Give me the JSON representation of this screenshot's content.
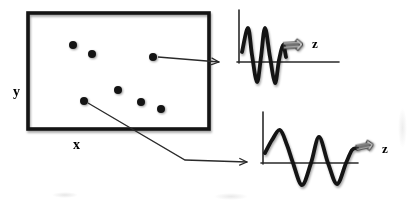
{
  "figure": {
    "background_color": "#ffffff",
    "ink_color": "#141414",
    "thin_line_color": "#2a2a2a",
    "block_arrow_fill": "#c6c6c6",
    "region_box": {
      "x": 28,
      "y": 13,
      "width": 181,
      "height": 116,
      "border_width": 3.6,
      "x_axis_label": "x",
      "y_axis_label": "y"
    },
    "dot_radius": 4,
    "dots": [
      [
        73,
        45
      ],
      [
        92,
        54
      ],
      [
        153,
        57
      ],
      [
        118,
        90
      ],
      [
        84,
        101
      ],
      [
        141,
        102
      ],
      [
        161,
        109
      ]
    ],
    "connector_arrows": [
      {
        "from_dot_index": 2,
        "points": [
          [
            158,
            57
          ],
          [
            219,
            62
          ]
        ]
      },
      {
        "from_dot_index": 4,
        "points": [
          [
            88,
            103
          ],
          [
            185,
            160
          ],
          [
            247,
            162
          ]
        ]
      }
    ],
    "plots": [
      {
        "name": "high-frequency-signal",
        "label": "z",
        "arrow_symbol": "⇒",
        "axis": {
          "x": 239,
          "y_top": 10,
          "y_bottom": 63,
          "y_axis_line": 62,
          "x_left": 237,
          "x_right": 339
        },
        "wave_points": [
          [
            242,
            52
          ],
          [
            248,
            28
          ],
          [
            252,
            55
          ],
          [
            257,
            82
          ],
          [
            261,
            57
          ],
          [
            265,
            28
          ],
          [
            270,
            57
          ],
          [
            275,
            83
          ],
          [
            279,
            60
          ],
          [
            283,
            45
          ],
          [
            286,
            57
          ]
        ],
        "wave_stroke_width": 3.8
      },
      {
        "name": "low-frequency-signal",
        "label": "z",
        "arrow_symbol": "⇒",
        "axis": {
          "x": 263,
          "y_top": 112,
          "y_bottom": 164,
          "y_axis_line": 163,
          "x_left": 261,
          "x_right": 358
        },
        "wave_points": [
          [
            265,
            153
          ],
          [
            272,
            140
          ],
          [
            280,
            130
          ],
          [
            287,
            145
          ],
          [
            293,
            163
          ],
          [
            302,
            185
          ],
          [
            311,
            163
          ],
          [
            319,
            137
          ],
          [
            328,
            163
          ],
          [
            337,
            184
          ],
          [
            346,
            163
          ],
          [
            352,
            150
          ],
          [
            357,
            148
          ]
        ],
        "wave_stroke_width": 3.8
      }
    ]
  }
}
